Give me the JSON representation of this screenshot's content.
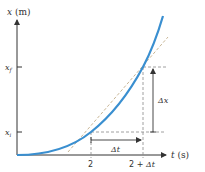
{
  "diagram": {
    "y_axis": {
      "var": "x",
      "unit": " (m)"
    },
    "x_axis": {
      "var": "t",
      "unit": " (s)"
    },
    "y_ticks": [
      {
        "id": "xf",
        "base": "x",
        "sub": "f"
      },
      {
        "id": "xi",
        "base": "x",
        "sub": "i"
      }
    ],
    "x_ticks": [
      {
        "id": "t0",
        "label": "2"
      },
      {
        "id": "t1",
        "label_prefix": "2 + ",
        "label_delta": "Δt"
      }
    ],
    "delta_t_label": "Δt",
    "delta_x_label": "Δx",
    "colors": {
      "curve": "#3a8fd0",
      "axes": "#333333",
      "dashed": "#888888",
      "chord": "#b9a27a"
    }
  }
}
